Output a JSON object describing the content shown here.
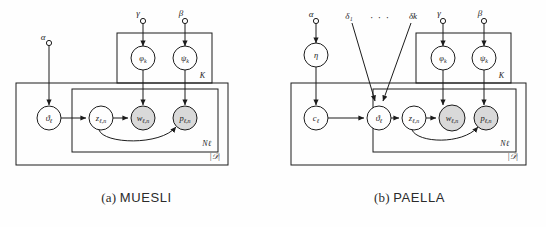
{
  "figure": {
    "background": "#fefefe",
    "ink": "#1c1c1c",
    "shaded_node_fill": "#d9d9d9",
    "open_node_fill": "#ffffff"
  },
  "panels": [
    {
      "id": "muesli",
      "caption_index": "(a)",
      "caption_name": "MUESLI",
      "hyperparameters": [
        {
          "name": "alpha",
          "label": "α"
        },
        {
          "name": "gamma",
          "label": "γ"
        },
        {
          "name": "beta",
          "label": "β"
        }
      ],
      "nodes": [
        {
          "name": "theta",
          "base": "ϑ",
          "sub": "ℓ",
          "shaded": false
        },
        {
          "name": "z",
          "base": "z",
          "sub": "ℓ,n",
          "shaded": false
        },
        {
          "name": "w",
          "base": "w",
          "sub": "ℓ,n",
          "shaded": true
        },
        {
          "name": "p",
          "base": "p",
          "sub": "ℓ,n",
          "shaded": true
        },
        {
          "name": "phi",
          "base": "φ",
          "sub": "k",
          "shaded": false
        },
        {
          "name": "psi",
          "base": "ψ",
          "sub": "k",
          "shaded": false
        }
      ],
      "plates": [
        {
          "name": "k-plate",
          "label": "K"
        },
        {
          "name": "n-plate",
          "label": "Nℓ"
        },
        {
          "name": "d-plate",
          "label": "|𝒟|"
        }
      ]
    },
    {
      "id": "paella",
      "caption_index": "(b)",
      "caption_name": "PAELLA",
      "hyperparameters": [
        {
          "name": "alpha",
          "label": "α"
        },
        {
          "name": "delta-1",
          "label": "δ₁"
        },
        {
          "name": "delta-ellipsis",
          "label": "· · ·"
        },
        {
          "name": "delta-k",
          "label": "δk"
        },
        {
          "name": "gamma",
          "label": "γ"
        },
        {
          "name": "beta",
          "label": "β"
        }
      ],
      "nodes": [
        {
          "name": "eta",
          "base": "η",
          "sub": "",
          "shaded": false
        },
        {
          "name": "c",
          "base": "c",
          "sub": "ℓ",
          "shaded": false
        },
        {
          "name": "theta",
          "base": "ϑ",
          "sub": "ℓ",
          "shaded": false
        },
        {
          "name": "z",
          "base": "z",
          "sub": "ℓ,n",
          "shaded": false
        },
        {
          "name": "w",
          "base": "w",
          "sub": "ℓ,n",
          "shaded": true
        },
        {
          "name": "p",
          "base": "p",
          "sub": "ℓ,n",
          "shaded": true
        },
        {
          "name": "phi",
          "base": "φ",
          "sub": "k",
          "shaded": false
        },
        {
          "name": "psi",
          "base": "ψ",
          "sub": "k",
          "shaded": false
        }
      ],
      "plates": [
        {
          "name": "k-plate",
          "label": "K"
        },
        {
          "name": "n-plate",
          "label": "Nℓ"
        },
        {
          "name": "d-plate",
          "label": "|𝒟|"
        }
      ]
    }
  ]
}
